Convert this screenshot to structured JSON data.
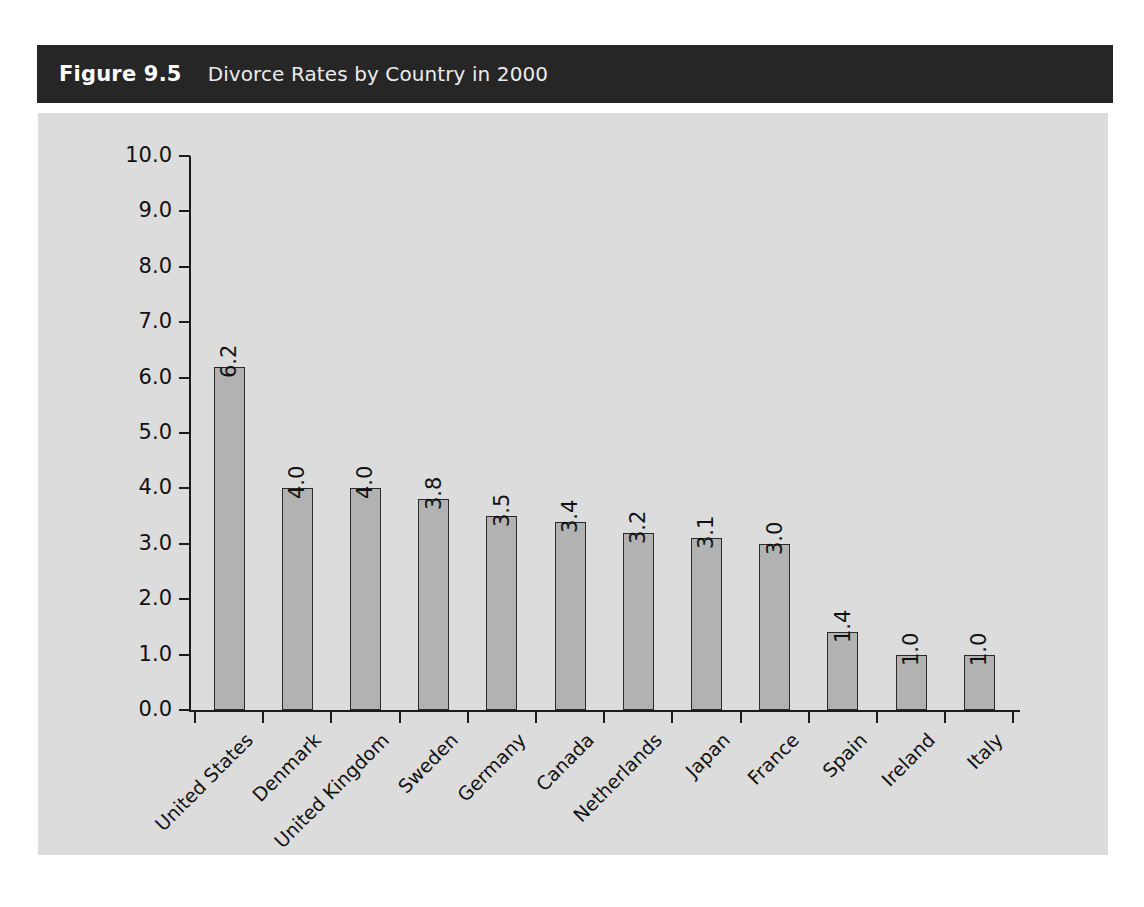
{
  "figure": {
    "number_label": "Figure 9.5",
    "title": "Divorce Rates by Country in 2000",
    "header_bg": "#262626",
    "panel_bg": "#dcdcdc",
    "bar_fill": "#b2b2b2",
    "bar_stroke": "#2a2a2a"
  },
  "chart_data": {
    "type": "bar",
    "title": "Divorce Rates by Country in 2000",
    "xlabel": "",
    "ylabel": "",
    "ylim": [
      0,
      10
    ],
    "ytick_labels": [
      "10.0",
      "9.0",
      "8.0",
      "7.0",
      "6.0",
      "5.0",
      "4.0",
      "3.0",
      "2.0",
      "1.0",
      "0.0"
    ],
    "ytick_values": [
      10,
      9,
      8,
      7,
      6,
      5,
      4,
      3,
      2,
      1,
      0
    ],
    "grid": false,
    "legend": null,
    "categories": [
      "United States",
      "Denmark",
      "United Kingdom",
      "Sweden",
      "Germany",
      "Canada",
      "Netherlands",
      "Japan",
      "France",
      "Spain",
      "Ireland",
      "Italy"
    ],
    "values": [
      6.2,
      4.0,
      4.0,
      3.8,
      3.5,
      3.4,
      3.2,
      3.1,
      3.0,
      1.4,
      1.0,
      1.0
    ],
    "value_labels": [
      "6.2",
      "4.0",
      "4.0",
      "3.8",
      "3.5",
      "3.4",
      "3.2",
      "3.1",
      "3.0",
      "1.4",
      "1.0",
      "1.0"
    ]
  }
}
